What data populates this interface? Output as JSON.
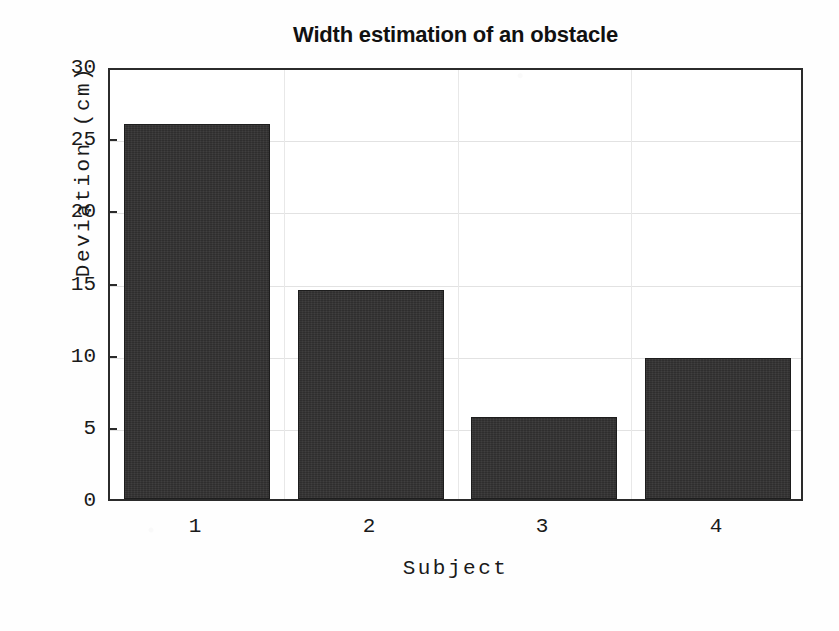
{
  "chart_data": {
    "type": "bar",
    "title": "Width estimation of an obstacle",
    "xlabel": "Subject",
    "ylabel": "Deviation (cm)",
    "categories": [
      "1",
      "2",
      "3",
      "4"
    ],
    "values": [
      26.0,
      14.5,
      5.7,
      9.8
    ],
    "ylim": [
      0,
      30
    ],
    "yticks": [
      0,
      5,
      10,
      15,
      20,
      25,
      30
    ],
    "ytick_labels": [
      "0",
      "5",
      "10",
      "15",
      "20",
      "25",
      "30"
    ],
    "xtick_labels": [
      "1",
      "2",
      "3",
      "4"
    ],
    "grid": true,
    "legend": null,
    "bar_color": "#333232",
    "axis_color": "#2b2b2b",
    "background": "#ffffff",
    "series": [
      {
        "name": "Deviation",
        "values": [
          26.0,
          14.5,
          5.7,
          9.8
        ]
      }
    ]
  }
}
